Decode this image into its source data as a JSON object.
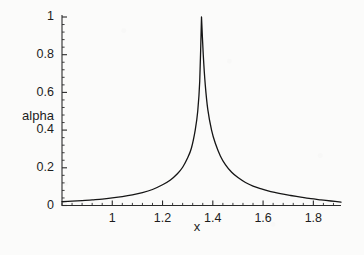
{
  "chart_data": {
    "type": "line",
    "title": "",
    "subtitle": "",
    "xlabel": "x",
    "ylabel": "alpha",
    "xlim": [
      0.8,
      1.91
    ],
    "ylim": [
      0,
      1.02
    ],
    "grid": false,
    "legend": null,
    "legend_position": "none",
    "xticks": [
      1,
      1.2,
      1.4,
      1.6,
      1.8
    ],
    "xtick_labels": [
      "1",
      "1.2",
      "1.4",
      "1.6",
      "1.8"
    ],
    "yticks": [
      0,
      0.2,
      0.4,
      0.6,
      0.8,
      1
    ],
    "ytick_labels": [
      "0",
      "0.2",
      "0.4",
      "0.6",
      "0.8",
      "1"
    ],
    "minor_tick_count": 4,
    "line_color": "#151515",
    "line_width": 1.3,
    "peak_x": 1.355,
    "peak_y": 1.0,
    "series": [
      {
        "name": "alpha",
        "x": [
          0.8,
          0.84,
          0.88,
          0.92,
          0.96,
          1.0,
          1.04,
          1.08,
          1.12,
          1.16,
          1.2,
          1.23,
          1.26,
          1.28,
          1.3,
          1.315,
          1.33,
          1.34,
          1.348,
          1.355,
          1.362,
          1.37,
          1.38,
          1.395,
          1.41,
          1.43,
          1.45,
          1.475,
          1.5,
          1.53,
          1.56,
          1.59,
          1.62,
          1.65,
          1.68,
          1.71,
          1.75,
          1.79,
          1.83,
          1.87,
          1.91
        ],
        "y": [
          0.02,
          0.023,
          0.026,
          0.03,
          0.034,
          0.04,
          0.047,
          0.056,
          0.068,
          0.085,
          0.11,
          0.134,
          0.17,
          0.203,
          0.253,
          0.305,
          0.4,
          0.5,
          0.66,
          1.0,
          0.8,
          0.64,
          0.51,
          0.4,
          0.33,
          0.263,
          0.217,
          0.176,
          0.148,
          0.122,
          0.103,
          0.089,
          0.077,
          0.068,
          0.06,
          0.053,
          0.044,
          0.036,
          0.03,
          0.024,
          0.018
        ]
      }
    ]
  },
  "axes": {
    "y_axis_label": "alpha",
    "x_axis_label": "x"
  },
  "colors": {
    "background": "#fbfbfa",
    "ink": "#1d1d1d",
    "curve": "#151515",
    "axis": "#2a2a2a"
  }
}
